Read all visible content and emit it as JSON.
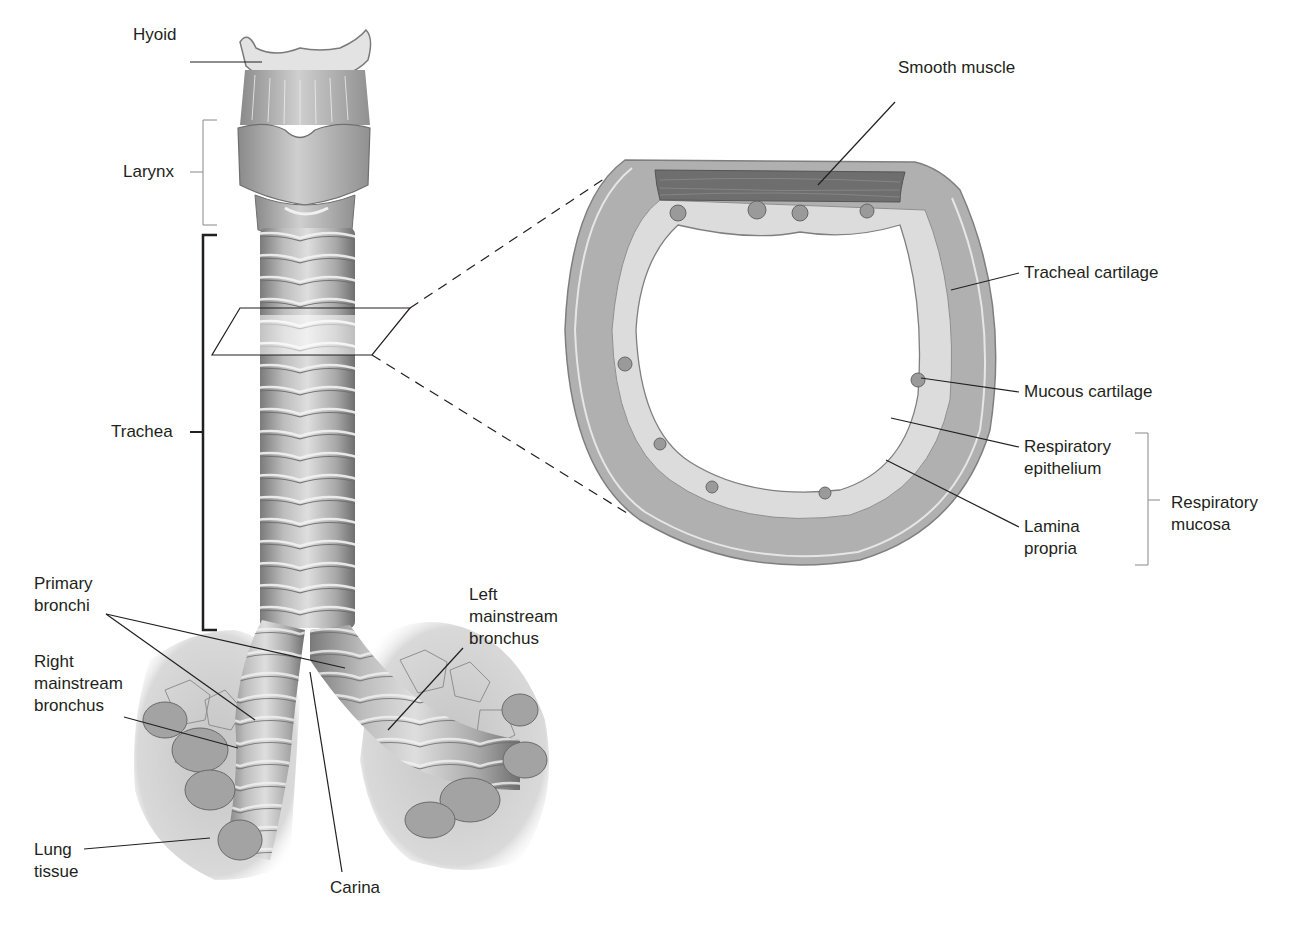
{
  "figure": {
    "left_panel": {
      "subject": "Larynx, trachea and bronchi (anterior view)",
      "labels": {
        "hyoid": "Hyoid",
        "larynx": "Larynx",
        "trachea": "Trachea",
        "primary_bronchi": [
          "Primary",
          "bronchi"
        ],
        "right_mainstream_bronchus": [
          "Right",
          "mainstream",
          "bronchus"
        ],
        "left_mainstream_bronchus": [
          "Left",
          "mainstream",
          "bronchus"
        ],
        "lung_tissue": [
          "Lung",
          "tissue"
        ],
        "carina": "Carina"
      }
    },
    "right_panel": {
      "subject": "Cross-section of trachea",
      "labels": {
        "smooth_muscle": "Smooth muscle",
        "tracheal_cartilage": "Tracheal cartilage",
        "mucous_cartilage": "Mucous cartilage",
        "respiratory_epithelium": [
          "Respiratory",
          "epithelium"
        ],
        "lamina_propria": [
          "Lamina",
          "propria"
        ],
        "respiratory_mucosa": [
          "Respiratory",
          "mucosa"
        ]
      }
    },
    "colors": {
      "background": "#ffffff",
      "label_text": "#231f20",
      "leader_line": "#231f20",
      "cartilage_fill": "#a9a9a9",
      "muscle_fill": "#6e6e6e",
      "mucosa_fill": "#dcdcdc",
      "tissue_fill": "#b8b8b8"
    }
  }
}
